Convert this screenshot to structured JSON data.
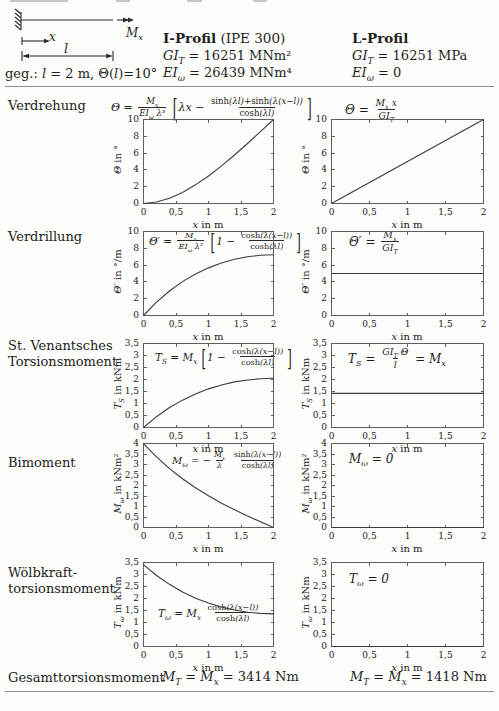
{
  "given_line": "\\u{geg.: }l\\u{ = 2 m, Θ(}l\\u{)=10°}",
  "diagram": {
    "labels": {
      "moment": "M_x",
      "axis": "x",
      "length": "l"
    }
  },
  "header": {
    "i_profil": {
      "title_bold": "I-Profil",
      "title_rest": " (IPE 300)",
      "gi": "GI_T = \\u{16251 MNm²}",
      "ei": "EI_ω = \\u{26439 MNm⁴}"
    },
    "l_profil": {
      "title_bold": "L-Profil",
      "title_rest": "",
      "gi": "GI_T = \\u{16251 MPa}",
      "ei": "EI_ω = \\u{0}"
    }
  },
  "rows": [
    {
      "label": [
        "Verdrehung"
      ],
      "formula_i": "Θ = \\f{M_x}{EI_ω λ³} \\[λx − \\f{\\u{sinh}(λl)+\\u{sinh}(λ(x−l))}{\\u{cosh}(λl)}\\]",
      "formula_l": "Θ = \\f{M_x x}{GI_T}"
    },
    {
      "label": [
        "Verdrillung"
      ],
      "formula_i": "Θ′ = \\f{M_x}{EI_ω λ²} \\[1 − \\f{\\u{cosh}(λ(x−l))}{\\u{cosh}(λl)}\\]",
      "formula_l": "Θ′ = \\f{M_x}{GI_T}"
    },
    {
      "label": [
        "St. Venantsches",
        "Torsionsmoment"
      ],
      "formula_i": "T_S = M_x \\[1 − \\f{\\u{cosh}(λ(x−l))}{\\u{cosh}(λl)}\\]",
      "formula_l": "T_S = \\f{GI_T Θ}{l} = M_x"
    },
    {
      "label": [
        "Bimoment"
      ],
      "formula_i": "M_ω = −\\f{M_x}{λ} \\f{\\u{sinh}(λ(x−l))}{\\u{cosh}(λl)}",
      "formula_l": "M_ω = 0"
    },
    {
      "label": [
        "Wölbkraft-",
        "torsionsmoment"
      ],
      "formula_i": "T_ω = M_x \\f{\\u{cosh}(λ(x−l))}{\\u{cosh}(λl)}",
      "formula_l": "T_ω = 0"
    }
  ],
  "totals": {
    "label": "Gesamttorsionsmoment",
    "i": "M_T = M_x = \\u{3414 Nm}",
    "l": "M_T = M_x = \\u{1418 Nm}"
  },
  "chart_data": [
    {
      "id": "verdrehung-i-profil",
      "type": "line",
      "plot_w": 130,
      "xlabel": "x \\u{in m}",
      "ylabel": "Θ \\u{in °}",
      "xlim": [
        0,
        2
      ],
      "ylim": [
        0,
        10
      ],
      "xticks": {
        "values": [
          0,
          0.5,
          1,
          1.5,
          2
        ],
        "labels": [
          "0",
          "0,5",
          "1",
          "1,5",
          "2"
        ]
      },
      "yticks": {
        "values": [
          0,
          2,
          4,
          6,
          8,
          10
        ],
        "labels": [
          "0",
          "2",
          "4",
          "6",
          "8",
          "10"
        ]
      },
      "x": [
        0,
        0.2,
        0.4,
        0.6,
        0.8,
        1.0,
        1.2,
        1.4,
        1.6,
        1.8,
        2.0
      ],
      "y": [
        0,
        0.17,
        0.62,
        1.32,
        2.22,
        3.28,
        4.48,
        5.77,
        7.14,
        8.56,
        10.0
      ]
    },
    {
      "id": "verdrehung-l-profil",
      "type": "line",
      "plot_w": 152,
      "xlabel": "x \\u{in m}",
      "ylabel": "Θ \\u{in °}",
      "xlim": [
        0,
        2
      ],
      "ylim": [
        0,
        10
      ],
      "xticks": {
        "values": [
          0,
          0.5,
          1,
          1.5,
          2
        ],
        "labels": [
          "0",
          "0,5",
          "1",
          "1,5",
          "2"
        ]
      },
      "yticks": {
        "values": [
          0,
          2,
          4,
          6,
          8,
          10
        ],
        "labels": [
          "0",
          "2",
          "4",
          "6",
          "8",
          "10"
        ]
      },
      "x": [
        0,
        2
      ],
      "y": [
        0,
        10
      ]
    },
    {
      "id": "verdrillung-i-profil",
      "type": "line",
      "plot_w": 130,
      "xlabel": "x \\u{in m}",
      "ylabel": "Θ′ \\u{in °/m}",
      "xlim": [
        0,
        2
      ],
      "ylim": [
        0,
        10
      ],
      "xticks": {
        "values": [
          0,
          0.5,
          1,
          1.5,
          2
        ],
        "labels": [
          "0",
          "0,5",
          "1",
          "1,5",
          "2"
        ]
      },
      "yticks": {
        "values": [
          0,
          2,
          4,
          6,
          8,
          10
        ],
        "labels": [
          "0",
          "2",
          "4",
          "6",
          "8",
          "10"
        ]
      },
      "x": [
        0,
        0.2,
        0.4,
        0.6,
        0.8,
        1.0,
        1.2,
        1.4,
        1.6,
        1.8,
        2.0
      ],
      "y": [
        0,
        1.59,
        2.92,
        4.03,
        4.94,
        5.67,
        6.25,
        6.69,
        6.99,
        7.17,
        7.23
      ]
    },
    {
      "id": "verdrillung-l-profil",
      "type": "line",
      "plot_w": 152,
      "xlabel": "x \\u{in m}",
      "ylabel": "Θ′ \\u{in °/m}",
      "xlim": [
        0,
        2
      ],
      "ylim": [
        0,
        10
      ],
      "xticks": {
        "values": [
          0,
          0.5,
          1,
          1.5,
          2
        ],
        "labels": [
          "0",
          "0,5",
          "1",
          "1,5",
          "2"
        ]
      },
      "yticks": {
        "values": [
          0,
          2,
          4,
          6,
          8,
          10
        ],
        "labels": [
          "0",
          "2",
          "4",
          "6",
          "8",
          "10"
        ]
      },
      "x": [
        0,
        2
      ],
      "y": [
        5,
        5
      ]
    },
    {
      "id": "st-venant-i-profil",
      "type": "line",
      "plot_w": 130,
      "xlabel": "x \\u{in m}",
      "ylabel": "T_S \\u{in kNm}",
      "xlim": [
        0,
        2
      ],
      "ylim": [
        0,
        3.5
      ],
      "xticks": {
        "values": [
          0,
          0.5,
          1,
          1.5,
          2
        ],
        "labels": [
          "0",
          "0,5",
          "1",
          "1,5",
          "2"
        ]
      },
      "yticks": {
        "values": [
          0,
          0.5,
          1,
          1.5,
          2,
          2.5,
          3,
          3.5
        ],
        "labels": [
          "0",
          "0,5",
          "1",
          "1,5",
          "2",
          "2,5",
          "3",
          "3,5"
        ]
      },
      "x": [
        0,
        0.2,
        0.4,
        0.6,
        0.8,
        1.0,
        1.2,
        1.4,
        1.6,
        1.8,
        2.0
      ],
      "y": [
        0,
        0.45,
        0.83,
        1.14,
        1.4,
        1.61,
        1.77,
        1.9,
        1.98,
        2.03,
        2.05
      ]
    },
    {
      "id": "st-venant-l-profil",
      "type": "line",
      "plot_w": 152,
      "xlabel": "x \\u{in m}",
      "ylabel": "T_S \\u{in kNm}",
      "xlim": [
        0,
        2
      ],
      "ylim": [
        0,
        3.5
      ],
      "xticks": {
        "values": [
          0,
          0.5,
          1,
          1.5,
          2
        ],
        "labels": [
          "0",
          "0,5",
          "1",
          "1,5",
          "2"
        ]
      },
      "yticks": {
        "values": [
          0,
          0.5,
          1,
          1.5,
          2,
          2.5,
          3,
          3.5
        ],
        "labels": [
          "0",
          "0,5",
          "1",
          "1,5",
          "2",
          "2,5",
          "3",
          "3,5"
        ]
      },
      "x": [
        0,
        2
      ],
      "y": [
        1.42,
        1.42
      ]
    },
    {
      "id": "bimoment-i-profil",
      "type": "line",
      "plot_w": 130,
      "xlabel": "x \\u{in m}",
      "ylabel": "M_ω \\u{in kNm²}",
      "xlim": [
        0,
        2
      ],
      "ylim": [
        0,
        4
      ],
      "xticks": {
        "values": [
          0,
          0.5,
          1,
          1.5,
          2
        ],
        "labels": [
          "0",
          "0,5",
          "1",
          "1,5",
          "2"
        ]
      },
      "yticks": {
        "values": [
          0,
          0.5,
          1,
          1.5,
          2,
          2.5,
          3,
          3.5,
          4
        ],
        "labels": [
          "0",
          "0,5",
          "1",
          "1,5",
          "2",
          "2,5",
          "3",
          "3,5",
          "4"
        ]
      },
      "x": [
        0,
        0.2,
        0.4,
        0.6,
        0.8,
        1.0,
        1.2,
        1.4,
        1.6,
        1.8,
        2.0
      ],
      "y": [
        3.99,
        3.36,
        2.8,
        2.32,
        1.89,
        1.51,
        1.16,
        0.85,
        0.55,
        0.27,
        0
      ]
    },
    {
      "id": "bimoment-l-profil",
      "type": "line",
      "plot_w": 152,
      "xlabel": "x \\u{in m}",
      "ylabel": "M_ω \\u{in kNm²}",
      "xlim": [
        0,
        2
      ],
      "ylim": [
        0,
        4
      ],
      "xticks": {
        "values": [
          0,
          0.5,
          1,
          1.5,
          2
        ],
        "labels": [
          "0",
          "0,5",
          "1",
          "1,5",
          "2"
        ]
      },
      "yticks": {
        "values": [
          0,
          0.5,
          1,
          1.5,
          2,
          2.5,
          3,
          3.5,
          4
        ],
        "labels": [
          "0",
          "0,5",
          "1",
          "1,5",
          "2",
          "2,5",
          "3",
          "3,5",
          "4"
        ]
      },
      "x": [
        0,
        2
      ],
      "y": [
        0,
        0
      ]
    },
    {
      "id": "woelbkraft-i-profil",
      "type": "line",
      "plot_w": 130,
      "xlabel": "x \\u{in m}",
      "ylabel": "T_ω \\u{in kNm}",
      "xlim": [
        0,
        2
      ],
      "ylim": [
        0,
        3.5
      ],
      "xticks": {
        "values": [
          0,
          0.5,
          1,
          1.5,
          2
        ],
        "labels": [
          "0",
          "0,5",
          "1",
          "1,5",
          "2"
        ]
      },
      "yticks": {
        "values": [
          0,
          0.5,
          1,
          1.5,
          2,
          2.5,
          3,
          3.5
        ],
        "labels": [
          "0",
          "0,5",
          "1",
          "1,5",
          "2",
          "2,5",
          "3",
          "3,5"
        ]
      },
      "x": [
        0,
        0.2,
        0.4,
        0.6,
        0.8,
        1.0,
        1.2,
        1.4,
        1.6,
        1.8,
        2.0
      ],
      "y": [
        3.41,
        2.96,
        2.59,
        2.27,
        2.01,
        1.81,
        1.64,
        1.52,
        1.43,
        1.38,
        1.36
      ]
    },
    {
      "id": "woelbkraft-l-profil",
      "type": "line",
      "plot_w": 152,
      "xlabel": "x \\u{in m}",
      "ylabel": "T_ω \\u{in kNm}",
      "xlim": [
        0,
        2
      ],
      "ylim": [
        0,
        3.5
      ],
      "xticks": {
        "values": [
          0,
          0.5,
          1,
          1.5,
          2
        ],
        "labels": [
          "0",
          "0,5",
          "1",
          "1,5",
          "2"
        ]
      },
      "yticks": {
        "values": [
          0,
          0.5,
          1,
          1.5,
          2,
          2.5,
          3,
          3.5
        ],
        "labels": [
          "0",
          "0,5",
          "1",
          "1,5",
          "2",
          "2,5",
          "3",
          "3,5"
        ]
      },
      "x": [
        0,
        2
      ],
      "y": [
        0,
        0
      ]
    }
  ]
}
